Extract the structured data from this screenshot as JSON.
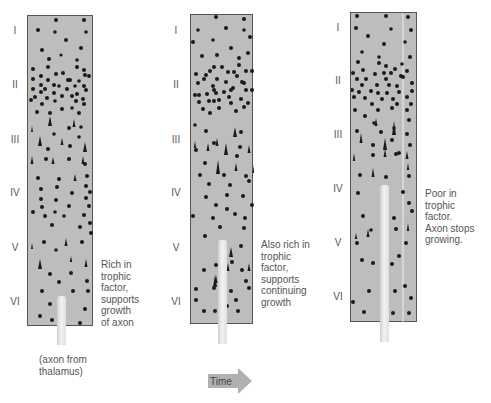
{
  "figure": {
    "layers": [
      "I",
      "II",
      "III",
      "IV",
      "V",
      "VI"
    ],
    "panels": [
      {
        "id": "panel-1",
        "caption_lines": [
          "Rich in",
          "trophic",
          "factor,",
          "supports",
          "growth",
          "of axon"
        ],
        "axon_label_lines": [
          "(axon from",
          "thalamus)"
        ]
      },
      {
        "id": "panel-2",
        "caption_lines": [
          "Also rich in",
          "trophic",
          "factor,",
          "supports",
          "continuing",
          "growth"
        ]
      },
      {
        "id": "panel-3",
        "caption_lines": [
          "Poor in",
          "trophic",
          "factor.",
          "Axon stops",
          "growing."
        ]
      }
    ],
    "time_arrow": {
      "label": "Time"
    },
    "colors": {
      "panel_fill": "#bdbdbd",
      "panel_border": "#555555",
      "dot": "#1a1a1a",
      "axon": "#e8e8e8",
      "arrow": "#b0b0b0"
    }
  }
}
